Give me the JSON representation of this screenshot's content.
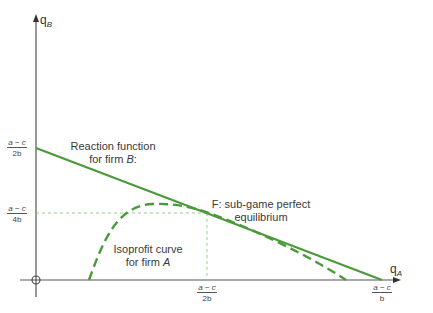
{
  "diagram": {
    "type": "economics-graph",
    "axes": {
      "x_label": "q",
      "x_label_sub": "A",
      "y_label": "q",
      "y_label_sub": "B"
    },
    "ticks": {
      "y_top": {
        "num": "a − c",
        "den": "2b"
      },
      "y_mid": {
        "num": "a − c",
        "den": "4b"
      },
      "x_mid": {
        "num": "a − c",
        "den": "2b"
      },
      "x_right": {
        "num": "a − c",
        "den": "b"
      }
    },
    "labels": {
      "reaction_line1": "Reaction function",
      "reaction_line2_pre": "for firm ",
      "reaction_line2_var": "B",
      "reaction_line2_post": ":",
      "equilibrium_line1": "F: sub-game perfect",
      "equilibrium_line2": "equilibrium",
      "isoprofit_line1": "Isoprofit curve",
      "isoprofit_line2_pre": "for firm ",
      "isoprofit_line2_var": "A"
    },
    "colors": {
      "curve_green": "#4a9a3a",
      "guide_green": "#7cc070",
      "axis": "#555555"
    }
  }
}
